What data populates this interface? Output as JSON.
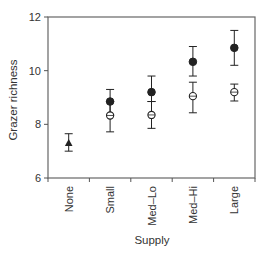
{
  "chart_data": {
    "type": "scatter",
    "title": "",
    "xlabel": "Supply",
    "ylabel": "Grazer richness",
    "categories": [
      "None",
      "Small",
      "Med–Lo",
      "Med–Hi",
      "Large"
    ],
    "ylim": [
      6,
      12
    ],
    "yticks": [
      6,
      8,
      10,
      12
    ],
    "grid": false,
    "legend": null,
    "series": [
      {
        "name": "control",
        "marker": "triangle-filled",
        "points": [
          {
            "category": "None",
            "value": 7.3,
            "err_low": 7.0,
            "err_high": 7.65
          }
        ]
      },
      {
        "name": "filled",
        "marker": "circle-filled",
        "points": [
          {
            "category": "Small",
            "value": 8.85,
            "err_low": 8.35,
            "err_high": 9.3
          },
          {
            "category": "Med–Lo",
            "value": 9.2,
            "err_low": 8.85,
            "err_high": 9.8
          },
          {
            "category": "Med–Hi",
            "value": 10.33,
            "err_low": 9.8,
            "err_high": 10.9
          },
          {
            "category": "Large",
            "value": 10.85,
            "err_low": 10.2,
            "err_high": 11.5
          }
        ]
      },
      {
        "name": "open",
        "marker": "circle-open",
        "points": [
          {
            "category": "Small",
            "value": 8.33,
            "err_low": 7.72,
            "err_high": 8.85
          },
          {
            "category": "Med–Lo",
            "value": 8.35,
            "err_low": 7.85,
            "err_high": 8.85
          },
          {
            "category": "Med–Hi",
            "value": 9.05,
            "err_low": 8.43,
            "err_high": 9.57
          },
          {
            "category": "Large",
            "value": 9.2,
            "err_low": 8.87,
            "err_high": 9.5
          }
        ]
      }
    ]
  },
  "colors": {
    "axis": "#555555",
    "marker": "#222222",
    "text": "#333333"
  }
}
